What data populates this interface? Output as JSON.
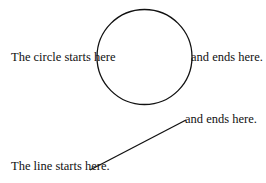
{
  "diagram": {
    "circle": {
      "start_label": "The circle starts here",
      "end_label": "and ends here.",
      "cx": 144.5,
      "cy": 57,
      "r": 47.5,
      "stroke": "#111111"
    },
    "line": {
      "start_label": "The line starts here.",
      "end_label": "and ends here.",
      "x1": 90,
      "y1": 170,
      "x2": 186,
      "y2": 120,
      "stroke": "#111111"
    },
    "background": "#ffffff"
  }
}
